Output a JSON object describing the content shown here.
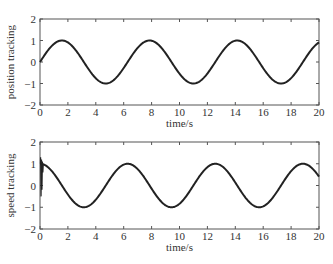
{
  "chart_data": [
    {
      "type": "line",
      "title": "",
      "xlabel": "time/s",
      "ylabel": "position tracking",
      "xlim": [
        0,
        20
      ],
      "ylim": [
        -2,
        2
      ],
      "xticks": [
        0,
        2,
        4,
        6,
        8,
        10,
        12,
        14,
        16,
        18,
        20
      ],
      "yticks": [
        -2,
        -1,
        0,
        1,
        2
      ],
      "ytick_labels": [
        "−2",
        "−1",
        "0",
        "1",
        "2"
      ],
      "grid": false,
      "series": [
        {
          "name": "position",
          "function": "sin(t)",
          "x": [
            0,
            1.57,
            4.71,
            7.85,
            11.0,
            14.14,
            17.28,
            20
          ],
          "y": [
            0,
            1,
            -1,
            1,
            -1,
            1,
            -1,
            0.91
          ]
        }
      ]
    },
    {
      "type": "line",
      "title": "",
      "xlabel": "time/s",
      "ylabel": "speed tracking",
      "xlim": [
        0,
        20
      ],
      "ylim": [
        -2,
        2
      ],
      "xticks": [
        0,
        2,
        4,
        6,
        8,
        10,
        12,
        14,
        16,
        18,
        20
      ],
      "yticks": [
        -2,
        -1,
        0,
        1,
        2
      ],
      "ytick_labels": [
        "−2",
        "−1",
        "0",
        "1",
        "2"
      ],
      "grid": false,
      "annotations": [
        "initial transient oscillation near t=0 between about -0.5 and 1.3"
      ],
      "series": [
        {
          "name": "speed",
          "function": "cos(t)",
          "x": [
            0,
            3.14,
            6.28,
            9.42,
            12.57,
            15.71,
            18.85,
            20
          ],
          "y": [
            1,
            -1,
            1,
            -1,
            1,
            -1,
            1,
            0.41
          ]
        }
      ]
    }
  ]
}
